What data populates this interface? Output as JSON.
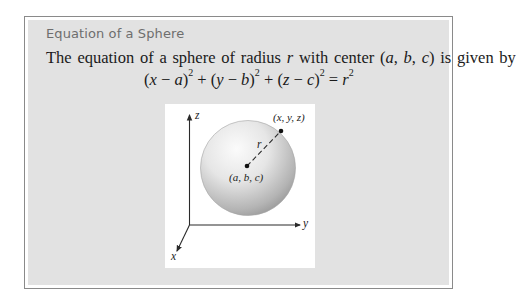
{
  "box": {
    "title": "Equation of a Sphere",
    "body": {
      "pre": "The equation of a sphere of radius ",
      "radius_var": "r",
      "mid": " with center (",
      "a": "a",
      "comma1": ", ",
      "b": "b",
      "comma2": ", ",
      "c": "c",
      "post": ") is given by"
    },
    "formula": {
      "t1_open": "(",
      "t1_var": "x",
      "t1_minus": " − ",
      "t1_const": "a",
      "t1_close": ")",
      "exp": "2",
      "plus1": " + ",
      "t2_open": "(",
      "t2_var": "y",
      "t2_minus": " − ",
      "t2_const": "b",
      "t2_close": ")",
      "plus2": " + ",
      "t3_open": "(",
      "t3_var": "z",
      "t3_minus": " − ",
      "t3_const": "c",
      "t3_close": ")",
      "equals": " = ",
      "rhs_var": "r"
    }
  },
  "figure": {
    "axis_labels": {
      "x": "x",
      "y": "y",
      "z": "z"
    },
    "point_label": "(x, y, z)",
    "center_label": "(a, b, c)",
    "radius_label": "r",
    "colors": {
      "sphere_light": "#fafafa",
      "sphere_dark": "#9a9a9a",
      "axis": "#2a2a2a",
      "panel_bg": "#ffffff",
      "box_bg": "#e2e2e2",
      "border": "#8a8a8a",
      "title": "#6e6e6e"
    }
  }
}
